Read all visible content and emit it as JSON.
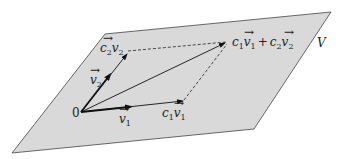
{
  "figure": {
    "plane_label": "V",
    "origin_label": "0",
    "vectors": {
      "v1": {
        "label": "v",
        "sub": "1"
      },
      "v2": {
        "label": "v",
        "sub": "2"
      }
    },
    "scaled": {
      "c1v1": {
        "coef": "c",
        "coef_sub": "1",
        "vec": "v",
        "vec_sub": "1"
      },
      "c2v2": {
        "coef": "c",
        "coef_sub": "2",
        "vec": "v",
        "vec_sub": "2"
      }
    },
    "sum": {
      "c1": "c",
      "c1_sub": "1",
      "v1": "v",
      "v1_sub": "1",
      "plus": "+",
      "c2": "c",
      "c2_sub": "2",
      "v2": "v",
      "v2_sub": "2"
    },
    "colors": {
      "plane_fill": "#d9d9d9",
      "plane_stroke": "#444444",
      "vector": "#111111"
    }
  }
}
